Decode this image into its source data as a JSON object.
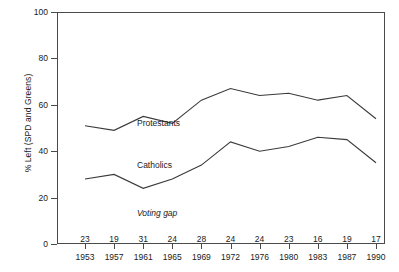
{
  "chart_data": {
    "type": "line",
    "title": "",
    "xlabel": "",
    "ylabel": "% Left (SPD and Greens)",
    "ylim": [
      0,
      100
    ],
    "yticks": [
      0,
      20,
      40,
      60,
      80,
      100
    ],
    "ytick_labels": [
      "0",
      "20",
      "40",
      "60",
      "80",
      "100"
    ],
    "grid": false,
    "legend": "inline-labels",
    "categories": [
      "1953",
      "1957",
      "1961",
      "1965",
      "1969",
      "1972",
      "1976",
      "1980",
      "1983",
      "1987",
      "1990"
    ],
    "series": [
      {
        "name": "Protestants",
        "values": [
          51,
          49,
          55,
          52,
          62,
          67,
          64,
          65,
          62,
          64,
          54
        ]
      },
      {
        "name": "Catholics",
        "values": [
          28,
          30,
          24,
          28,
          34,
          44,
          40,
          42,
          46,
          45,
          35
        ]
      }
    ],
    "annotations": {
      "voting_gap_label": "Voting gap",
      "voting_gap_values": [
        "23",
        "19",
        "31",
        "24",
        "28",
        "24",
        "24",
        "23",
        "16",
        "19",
        "17"
      ]
    },
    "colors": {
      "line": "#3a3a3a",
      "axis": "#4a4a4a",
      "text": "#1a1a1a"
    }
  }
}
